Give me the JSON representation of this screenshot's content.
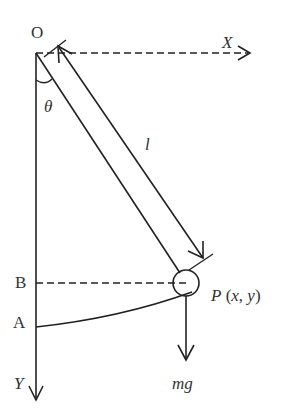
{
  "diagram": {
    "colors": {
      "stroke": "#222222",
      "text": "#333333",
      "background": "#ffffff"
    },
    "labels": {
      "origin": "O",
      "x_axis": "X",
      "y_axis": "Y",
      "angle": "θ",
      "length": "l",
      "point_b": "B",
      "point_a": "A",
      "bob": "P (x, y)",
      "force": "mg"
    }
  }
}
